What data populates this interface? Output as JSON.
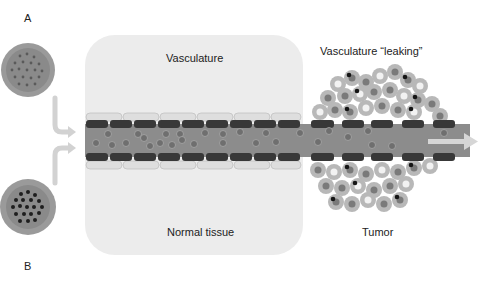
{
  "labels": {
    "a": "A",
    "b": "B",
    "vasculature_normal": "Vasculature",
    "vasculature_leaking": "Vasculature “leaking”",
    "normal_tissue": "Normal tissue",
    "tumor": "Tumor"
  },
  "colors": {
    "background": "#ffffff",
    "tissue_panel": "#ececec",
    "vessel_lumen": "#8a8a8a",
    "endothelial_dark": "#3a3a3a",
    "endothelial_pale": "#dcdcdc",
    "particle": "#6e6e6e",
    "tumor_cell_ring": "#b5b5b5",
    "particle_core_dark": "#1a1a1a",
    "arrow": "#d0d0d0"
  },
  "diagram": {
    "nodes": [
      {
        "id": "A",
        "type": "nanoparticle",
        "desc": "particle with small sparse dots"
      },
      {
        "id": "B",
        "type": "nanoparticle",
        "desc": "particle with dense dark dots"
      },
      {
        "id": "vessel",
        "type": "blood-vessel"
      },
      {
        "id": "normal",
        "type": "region",
        "label": "Normal tissue"
      },
      {
        "id": "tumor",
        "type": "region",
        "label": "Tumor"
      }
    ],
    "edges": [
      {
        "from": "A",
        "to": "vessel"
      },
      {
        "from": "B",
        "to": "vessel"
      },
      {
        "from": "vessel",
        "to": "exit"
      }
    ]
  }
}
